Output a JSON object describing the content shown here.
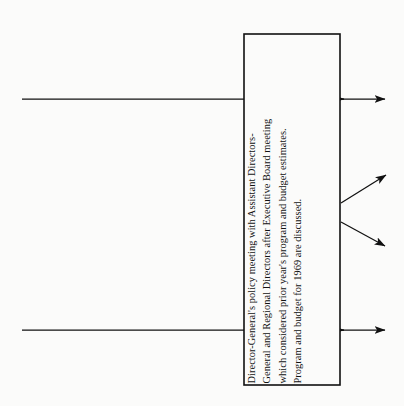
{
  "diagram": {
    "type": "flowchart",
    "background_color": "#fbfbfa",
    "stroke_color": "#111111",
    "process_box": {
      "label": "Director-General's policy meeting",
      "border_color": "#111111",
      "fill_color": "#fbfbfa",
      "text_orientation": "rotated-90-ccw",
      "lines": [
        "Director-General's policy meeting with Assistant Directors-",
        "General and Regional Directors after Executive Board meeting",
        "which considered prior year's program and budget estimates.",
        "Program and budget for 1969 are discussed."
      ]
    },
    "input_arrows": [
      {
        "name": "input-arrow-top",
        "direction": "right"
      },
      {
        "name": "input-arrow-bottom",
        "direction": "right"
      }
    ],
    "output_arrows": [
      {
        "name": "output-arrow-top",
        "direction": "right"
      },
      {
        "name": "output-arrow-upper-diagonal",
        "direction": "up-right"
      },
      {
        "name": "output-arrow-lower-diagonal",
        "direction": "down-right"
      },
      {
        "name": "output-arrow-bottom",
        "direction": "right"
      }
    ]
  }
}
